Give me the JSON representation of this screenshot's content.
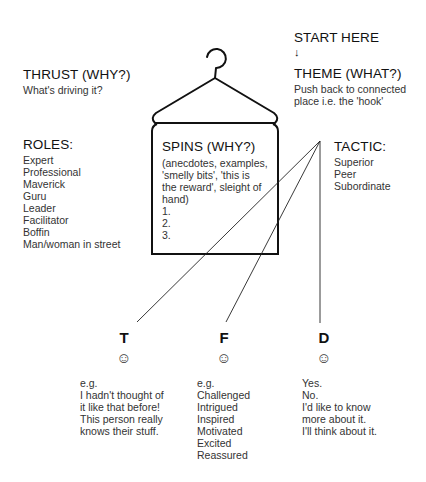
{
  "start": {
    "label": "START HERE",
    "arrow": "↓"
  },
  "theme": {
    "title": "THEME (WHAT?)",
    "lines": [
      "Push back to connected",
      "place i.e. the 'hook'"
    ]
  },
  "thrust": {
    "title": "THRUST (WHY?)",
    "subtitle": "What's driving it?"
  },
  "roles": {
    "title": "ROLES:",
    "items": [
      "Expert",
      "Professional",
      "Maverick",
      "Guru",
      "Leader",
      "Facilitator",
      "Boffin",
      "Man/woman in street"
    ]
  },
  "spins": {
    "title": "SPINS (WHY?)",
    "lines": [
      "(anecdotes, examples,",
      "'smelly bits', 'this is",
      "the reward', sleight of",
      "hand)",
      "1.",
      "2.",
      "3."
    ]
  },
  "tactic": {
    "title": "TACTIC:",
    "items": [
      "Superior",
      "Peer",
      "Subordinate"
    ]
  },
  "outcomes": [
    {
      "letter": "T",
      "icon": "☺",
      "lines": [
        "e.g.",
        "I hadn't thought of",
        "it like that before!",
        "This person really",
        "knows their stuff."
      ]
    },
    {
      "letter": "F",
      "icon": "☺",
      "lines": [
        "e.g.",
        "Challenged",
        "Intrigued",
        "Inspired",
        "Motivated",
        "Excited",
        "Reassured"
      ]
    },
    {
      "letter": "D",
      "icon": "☺",
      "lines": [
        "Yes.",
        "No.",
        "I'd like to know",
        "more about it.",
        "I'll think about it."
      ]
    }
  ],
  "colors": {
    "stroke": "#111111",
    "text": "#333333"
  }
}
